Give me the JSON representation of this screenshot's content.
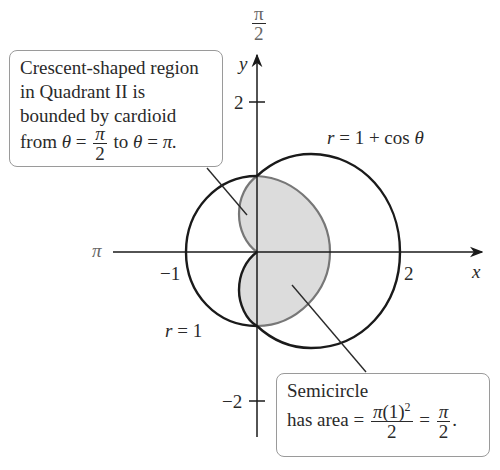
{
  "figure": {
    "type": "polar-area-diagram",
    "axes": {
      "x_label": "x",
      "y_label": "y",
      "x_ticks": [
        {
          "value": -1,
          "label": "−1"
        },
        {
          "value": 2,
          "label": "2"
        }
      ],
      "y_ticks": [
        {
          "value": 2,
          "label": "2"
        },
        {
          "value": -2,
          "label": "−2"
        }
      ],
      "polar_angle_labels": {
        "top": {
          "numerator": "π",
          "denominator": "2"
        },
        "left": "π"
      }
    },
    "curves": [
      {
        "name": "outer-curve",
        "label": "r = 1 + cos θ",
        "color": "#1a1a1a"
      },
      {
        "name": "unit-circle-arc",
        "label": "r = 1",
        "color": "#1a1a1a"
      },
      {
        "name": "inner-cardioid",
        "color": "#777777"
      }
    ],
    "shaded_region": {
      "fill": "#dcdcdc",
      "description": "semicircle plus crescent bounded by cardioid"
    },
    "curve_labels": {
      "cardioid": {
        "r": "r",
        "eq": "=",
        "rhs": "1 + cos",
        "theta": "θ"
      },
      "circle": {
        "r": "r",
        "eq": "=",
        "rhs": "1"
      }
    }
  },
  "callouts": {
    "crescent": {
      "line1": "Crescent-shaped region",
      "line2": "in Quadrant II is",
      "line3": "bounded by cardioid",
      "line4_prefix": "from",
      "theta": "θ",
      "eq": "=",
      "frac_num": "π",
      "frac_den": "2",
      "to": "to",
      "theta2": "θ",
      "eq2": "=",
      "end": "π."
    },
    "semicircle": {
      "line1": "Semicircle",
      "prefix": "has area =",
      "frac1_num_pi": "π",
      "frac1_num_rest": "(1)",
      "frac1_num_exp": "2",
      "frac1_den": "2",
      "eq": "=",
      "frac2_num": "π",
      "frac2_den": "2",
      "end": "."
    }
  }
}
